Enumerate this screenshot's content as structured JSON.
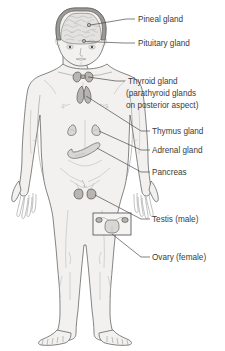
{
  "figure": {
    "body_fill": "#f2f1ef",
    "outline_color": "#5d5d5d",
    "text_color": "#3b3b3b",
    "leader_color": "#4a4a4a",
    "background": "#ffffff"
  },
  "labels": [
    {
      "id": "pineal",
      "text": "Pineal gland",
      "x": 138,
      "y": 22,
      "tick_x1": 126,
      "tick_x2": 135,
      "tick_y": 19
    },
    {
      "id": "pituitary",
      "text": "Pituitary gland",
      "x": 138,
      "y": 46,
      "tick_x1": 124,
      "tick_x2": 135,
      "tick_y": 43
    },
    {
      "id": "thyroid",
      "text": "Thyroid gland",
      "x": 128,
      "y": 84,
      "tick_x1": 116,
      "tick_x2": 125,
      "tick_y": 81
    },
    {
      "id": "parathyroid",
      "text": "(parathyroid glands",
      "x": 126,
      "y": 96
    },
    {
      "id": "posterior",
      "text": "on posterior aspect)",
      "x": 126,
      "y": 108
    },
    {
      "id": "thymus",
      "text": "Thymus gland",
      "x": 152,
      "y": 134,
      "tick_x1": 141,
      "tick_x2": 150,
      "tick_y": 131
    },
    {
      "id": "adrenal",
      "text": "Adrenal gland",
      "x": 152,
      "y": 153,
      "tick_x1": 141,
      "tick_x2": 150,
      "tick_y": 150
    },
    {
      "id": "pancreas",
      "text": "Pancreas",
      "x": 152,
      "y": 175,
      "tick_x1": 141,
      "tick_x2": 150,
      "tick_y": 172
    },
    {
      "id": "testis",
      "text": "Testis (male)",
      "x": 152,
      "y": 222,
      "tick_x1": 141,
      "tick_x2": 150,
      "tick_y": 219
    },
    {
      "id": "ovary",
      "text": "Ovary (female)",
      "x": 152,
      "y": 260,
      "tick_x1": 141,
      "tick_x2": 150,
      "tick_y": 257
    }
  ],
  "organs": [
    {
      "id": "pineal-gland",
      "name": "pineal gland",
      "location": "centre of brain"
    },
    {
      "id": "pituitary-gland",
      "name": "pituitary gland",
      "location": "base of brain"
    },
    {
      "id": "thyroid-gland",
      "name": "thyroid gland",
      "location": "anterior neck"
    },
    {
      "id": "thymus-gland",
      "name": "thymus gland",
      "location": "upper mediastinum"
    },
    {
      "id": "adrenal-glands",
      "name": "adrenal glands",
      "location": "superior poles of kidneys"
    },
    {
      "id": "pancreas",
      "name": "pancreas",
      "location": "upper abdomen"
    },
    {
      "id": "testes",
      "name": "testes",
      "location": "scrotum"
    },
    {
      "id": "ovaries",
      "name": "ovaries",
      "location": "pelvis, inset detail"
    }
  ],
  "inset": {
    "id": "ovary-inset",
    "description": "uterus with fallopian tubes and ovaries",
    "x": 93,
    "y": 213,
    "width": 38,
    "height": 22
  }
}
